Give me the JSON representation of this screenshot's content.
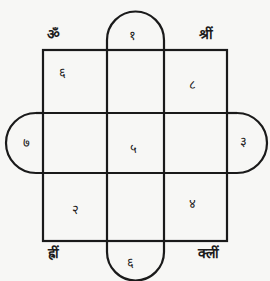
{
  "diagram": {
    "type": "yantra-magic-square",
    "stroke_color": "#1a1a1a",
    "background_color": "#f7f7f5",
    "corner_mantras": {
      "top_left": "ॐ",
      "top_right": "श्रीं",
      "bottom_left": "ह्रीं",
      "bottom_right": "क्लीं"
    },
    "grid": {
      "rows": [
        [
          "६",
          "",
          "८"
        ],
        [
          "",
          "५",
          ""
        ],
        [
          "२",
          "",
          "४"
        ]
      ]
    },
    "tabs": {
      "top": "१",
      "left": "७",
      "right": "३",
      "bottom": "६"
    }
  }
}
